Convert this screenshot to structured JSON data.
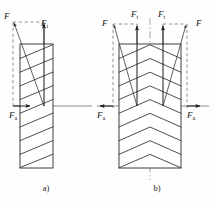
{
  "figure": {
    "background_color": "#fefefe",
    "line_color": "#2b2b2b",
    "dashed_color": "#777777",
    "width": 215,
    "height": 203,
    "panels": [
      {
        "id": "a",
        "caption": "a)",
        "caption_x": 46,
        "caption_y": 191,
        "gear_type": "single-helical",
        "body": {
          "x": 20,
          "y": 44,
          "width": 33,
          "height": 124
        },
        "helix_line_count": 9,
        "labels": [
          {
            "name": "resultant-force",
            "base": "F",
            "sub": "",
            "x": 4,
            "y": 19
          },
          {
            "name": "tangential-force",
            "base": "F",
            "sub": "t",
            "x": 41,
            "y": 26
          },
          {
            "name": "axial-force",
            "base": "F",
            "sub": "a",
            "x": 9,
            "y": 118
          }
        ]
      },
      {
        "id": "b",
        "caption": "b)",
        "caption_x": 157,
        "caption_y": 191,
        "gear_type": "herringbone-double-helical",
        "body": {
          "x": 119,
          "y": 44,
          "width": 62,
          "height": 124
        },
        "chevron_row_count": 9,
        "labels": [
          {
            "name": "resultant-force-left",
            "base": "F",
            "sub": "",
            "x": 104,
            "y": 26
          },
          {
            "name": "tangential-force-left",
            "base": "F",
            "sub": "t",
            "x": 131,
            "y": 17
          },
          {
            "name": "tangential-force-right",
            "base": "F",
            "sub": "t",
            "x": 165,
            "y": 17
          },
          {
            "name": "resultant-force-right",
            "base": "F",
            "sub": "",
            "x": 196,
            "y": 26
          },
          {
            "name": "axial-force-left",
            "base": "F",
            "sub": "a",
            "x": 99,
            "y": 118
          },
          {
            "name": "axial-force-right",
            "base": "F",
            "sub": "a",
            "x": 189,
            "y": 118
          }
        ]
      }
    ]
  }
}
